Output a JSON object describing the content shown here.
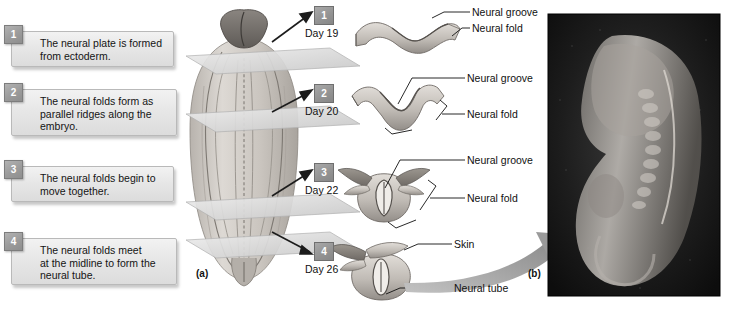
{
  "figure": {
    "panel_a_label": "(a)",
    "panel_b_label": "(b)"
  },
  "steps": [
    {
      "number": "1",
      "text": "The neural plate is formed\nfrom ectoderm."
    },
    {
      "number": "2",
      "text": "The neural folds form as\nparallel ridges along the\nembryo."
    },
    {
      "number": "3",
      "text": "The neural folds begin to\nmove together."
    },
    {
      "number": "4",
      "text": "The neural folds meet\nat the midline to form the\nneural tube."
    }
  ],
  "stages": [
    {
      "number": "1",
      "day": "Day 19",
      "labels": [
        "Neural groove",
        "Neural fold"
      ]
    },
    {
      "number": "2",
      "day": "Day 20",
      "labels": [
        "Neural groove",
        "Neural fold"
      ]
    },
    {
      "number": "3",
      "day": "Day 22",
      "labels": [
        "Neural groove",
        "Neural fold"
      ]
    },
    {
      "number": "4",
      "day": "Day 26",
      "labels": [
        "Skin",
        "Neural tube"
      ]
    }
  ],
  "cross_section_labels": {
    "s1_groove": "Neural groove",
    "s1_fold": "Neural fold",
    "s2_groove": "Neural groove",
    "s2_fold": "Neural fold",
    "s3_groove": "Neural groove",
    "s3_fold": "Neural fold",
    "s4_skin": "Skin",
    "s4_tube": "Neural tube"
  },
  "colors": {
    "tissue_light": "#d6d2cd",
    "tissue_mid": "#b6b1ab",
    "tissue_dark": "#8e8984",
    "plane": "#d9d9d9",
    "arrow": "#1c1c1c",
    "curved_arrow": "#9a9a9a",
    "photo_bg": "#141414",
    "badge": "#9b9b9b"
  }
}
